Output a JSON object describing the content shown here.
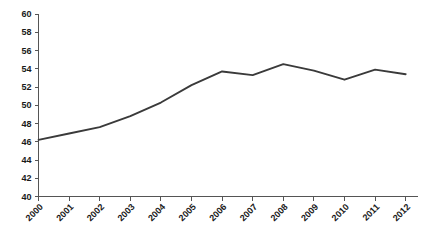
{
  "chart_data": {
    "type": "line",
    "title": "",
    "subtitle": "",
    "xlabel": "",
    "ylabel": "",
    "categories": [
      "2000",
      "2001",
      "2002",
      "2003",
      "2004",
      "2005",
      "2006",
      "2007",
      "2008",
      "2009",
      "2010",
      "2011",
      "2012"
    ],
    "values": [
      46.2,
      46.9,
      47.6,
      48.8,
      50.3,
      52.2,
      53.7,
      53.3,
      54.5,
      53.8,
      52.8,
      53.9,
      53.4
    ],
    "series": [
      {
        "name": "",
        "values": [
          46.2,
          46.9,
          47.6,
          48.8,
          50.3,
          52.2,
          53.7,
          53.3,
          54.5,
          53.8,
          52.8,
          53.9,
          53.4
        ],
        "color": "#3a3a3a"
      }
    ],
    "ylim": [
      40,
      60
    ],
    "yticks": [
      40,
      42,
      44,
      46,
      48,
      50,
      52,
      54,
      56,
      58,
      60
    ],
    "ytick_labels": [
      "40",
      "42",
      "44",
      "46",
      "48",
      "50",
      "52",
      "54",
      "56",
      "58",
      "60"
    ],
    "xticks": [
      "2000",
      "2001",
      "2002",
      "2003",
      "2004",
      "2005",
      "2006",
      "2007",
      "2008",
      "2009",
      "2010",
      "2011",
      "2012"
    ],
    "grid": false,
    "legend": false,
    "legend_position": "none",
    "xlabel_rotation": -45,
    "background_color": "#ffffff",
    "axis_color": "#555555",
    "text_color": "#1a1a1a"
  }
}
